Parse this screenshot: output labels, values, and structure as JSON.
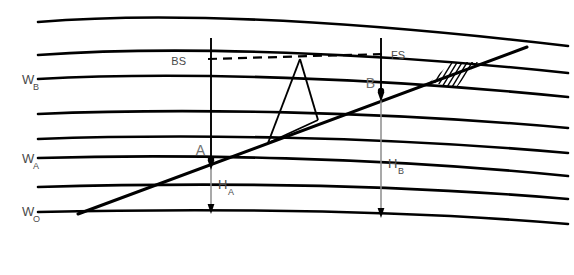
{
  "figure": {
    "type": "surveying-levelling-diagram",
    "background_color": "#ffffff",
    "line_color": "#000000",
    "label_color": "#4a4a4a",
    "dimension_color": "#8c8c8c",
    "width": 574,
    "height": 275
  },
  "labels": {
    "surface_b": "W",
    "surface_b_sub": "B",
    "surface_a": "W",
    "surface_a_sub": "A",
    "surface_zero": "W",
    "surface_zero_sub": "O",
    "backsight": "BS",
    "foresight": "FS",
    "point_a": "A",
    "point_b": "B",
    "height_a": "H",
    "height_a_sub": "A",
    "height_b": "H",
    "height_b_sub": "B"
  },
  "elements": {
    "equipotential_surfaces": [
      {
        "name": "surface-top-1",
        "label": "",
        "left_y": 22,
        "right_y": 46
      },
      {
        "name": "surface-top-2",
        "label": "",
        "left_y": 55,
        "right_y": 73
      },
      {
        "name": "surface-wb",
        "label": "W_B",
        "left_y": 79,
        "right_y": 97
      },
      {
        "name": "surface-mid-1",
        "label": "",
        "left_y": 114,
        "right_y": 128
      },
      {
        "name": "surface-mid-2",
        "label": "",
        "left_y": 139,
        "right_y": 153
      },
      {
        "name": "surface-wa",
        "label": "W_A",
        "left_y": 158,
        "right_y": 176
      },
      {
        "name": "surface-low-1",
        "label": "",
        "left_y": 187,
        "right_y": 199
      },
      {
        "name": "surface-wo",
        "label": "W_O",
        "left_y": 212,
        "right_y": 224
      }
    ],
    "terrain": {
      "name": "ground-surface-line",
      "start": {
        "x": 78,
        "y": 214
      },
      "end": {
        "x": 527,
        "y": 47
      }
    },
    "sight_line": {
      "name": "line-of-sight",
      "start": {
        "x": 210,
        "y": 59
      },
      "end": {
        "x": 381,
        "y": 54
      },
      "style": "dashed"
    },
    "staff_a": {
      "name": "levelling-staff-at-a",
      "x": 211,
      "top_y": 38,
      "bottom_y": 160
    },
    "staff_b": {
      "name": "levelling-staff-at-b",
      "x": 381,
      "top_y": 38,
      "bottom_y": 92
    },
    "instrument": {
      "name": "levelling-instrument-tripod",
      "apex": {
        "x": 300,
        "y": 59
      },
      "leg_left": {
        "x": 268,
        "y": 143
      },
      "leg_right": {
        "x": 318,
        "y": 120
      }
    },
    "station_a": {
      "name": "station-point-a",
      "x": 211,
      "y": 159
    },
    "station_b": {
      "name": "station-point-b",
      "x": 381,
      "y": 91
    },
    "height_a_dimension": {
      "name": "height-a-dimension",
      "x": 211,
      "from_y": 160,
      "to_y": 212
    },
    "height_b_dimension": {
      "name": "height-b-dimension",
      "x": 381,
      "from_y": 92,
      "to_y": 216
    },
    "hatch_region": {
      "name": "terrain-hatching",
      "center_x": 452,
      "center_y": 74
    }
  }
}
